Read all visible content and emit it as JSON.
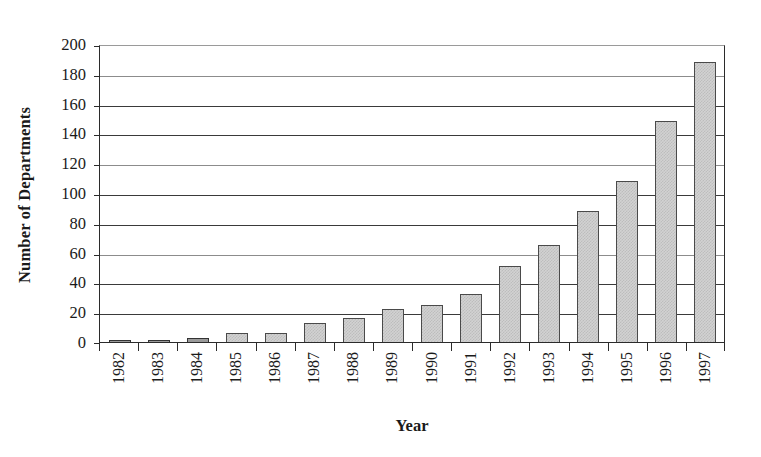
{
  "chart_data": {
    "type": "bar",
    "title": "",
    "xlabel": "Year",
    "ylabel": "Number of Departments",
    "categories": [
      "1982",
      "1983",
      "1984",
      "1985",
      "1986",
      "1987",
      "1988",
      "1989",
      "1990",
      "1991",
      "1992",
      "1993",
      "1994",
      "1995",
      "1996",
      "1997"
    ],
    "values": [
      1,
      1,
      3,
      6,
      6,
      13,
      16,
      22,
      25,
      32,
      51,
      65,
      88,
      108,
      148,
      188
    ],
    "ylim": [
      0,
      200
    ],
    "yticks": [
      0,
      20,
      40,
      60,
      80,
      100,
      120,
      140,
      160,
      180,
      200
    ],
    "ytick_labels": [
      "0",
      "20",
      "40",
      "60",
      "80",
      "100",
      "120",
      "140",
      "160",
      "180",
      "200"
    ],
    "grid": "horizontal",
    "legend": "none",
    "series": [
      {
        "name": "Number of Departments",
        "values": [
          1,
          1,
          3,
          6,
          6,
          13,
          16,
          22,
          25,
          32,
          51,
          65,
          88,
          108,
          148,
          188
        ]
      }
    ],
    "colors": {
      "bar_fill": "#d2d2d2",
      "bar_pattern": "#bdbdbd",
      "bar_border": "#4a4a4a",
      "gridline": "#3a3a3a",
      "axis": "#2b2b2b",
      "background": "#ffffff",
      "text": "#1a1a1a"
    }
  }
}
